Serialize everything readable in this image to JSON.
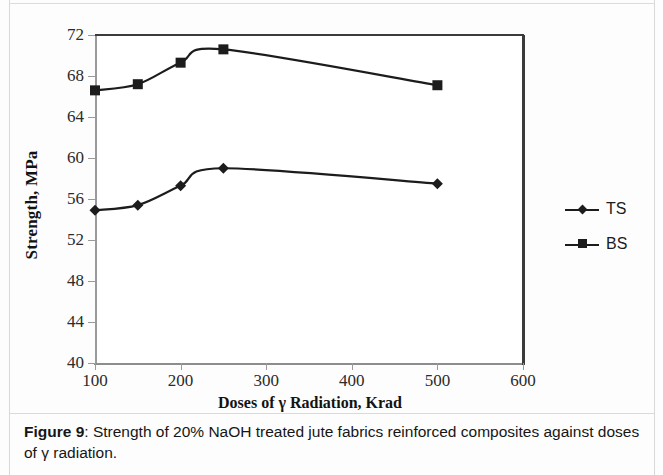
{
  "figure": {
    "caption_label": "Figure 9",
    "caption_separator": ":",
    "caption_text": " Strength of 20% NaOH treated jute fabrics reinforced composites against doses of γ radiation."
  },
  "chart_data": {
    "type": "line",
    "title": "",
    "xlabel": "Doses of γ Radiation, Krad",
    "ylabel": "Strength, MPa",
    "x": [
      100,
      150,
      200,
      250,
      500
    ],
    "xlim": [
      100,
      600
    ],
    "ylim": [
      40,
      72
    ],
    "xticks": [
      100,
      200,
      300,
      400,
      500,
      600
    ],
    "yticks": [
      40,
      44,
      48,
      52,
      56,
      60,
      64,
      68,
      72
    ],
    "xtick_labels": [
      "100",
      "200",
      "300",
      "400",
      "500",
      "600"
    ],
    "ytick_labels": [
      "40",
      "44",
      "48",
      "52",
      "56",
      "60",
      "64",
      "68",
      "72"
    ],
    "grid": false,
    "legend_position": "right",
    "series": [
      {
        "name": "TS",
        "marker": "diamond",
        "color": "#1c1c1c",
        "values": [
          54.9,
          55.4,
          57.3,
          59.0,
          57.5
        ]
      },
      {
        "name": "BS",
        "marker": "square",
        "color": "#1c1c1c",
        "values": [
          66.6,
          67.2,
          69.3,
          70.6,
          67.1
        ]
      }
    ]
  }
}
